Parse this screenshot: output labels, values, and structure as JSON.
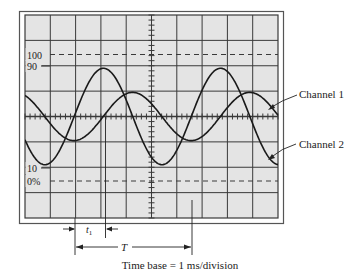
{
  "figure": {
    "type": "oscilloscope-display",
    "grid": {
      "columns": 10,
      "rows": 8,
      "screen_color": "#e4e4e4",
      "line_color": "#3a3a3a",
      "frame_color": "#555555"
    },
    "scale_labels": {
      "level_100": "100",
      "level_90": "90",
      "level_10": "10",
      "level_0": "0%"
    },
    "channels": [
      {
        "name": "Channel 1",
        "label": "Channel 1",
        "amplitude_div": 0.95,
        "period_div": 4.63,
        "phase_peak_div": 4.25
      },
      {
        "name": "Channel 2",
        "label": "Channel 2",
        "amplitude_div": 1.9,
        "period_div": 4.63,
        "phase_peak_div": 3.1
      }
    ],
    "annotations": {
      "t1_label": "t",
      "t1_subscript": "1",
      "period_label": "T",
      "time_base": "Time base = 1 ms/division"
    },
    "trace_color": "#1a1a1a"
  }
}
